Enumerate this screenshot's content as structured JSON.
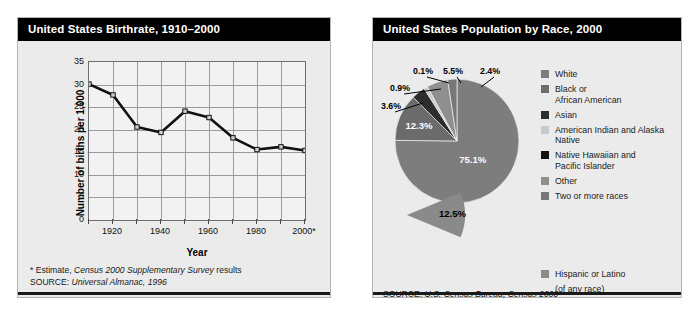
{
  "birthrate_panel": {
    "title": "United States Birthrate, 1910–2000",
    "footnote": "* Estimate, ",
    "footnote_italic": "Census 2000 Supplementary Survey",
    "footnote_tail": " results",
    "source_label": "SOURCE: ",
    "source_italic": "Universal Almanac, 1996"
  },
  "race_panel": {
    "title": "United States Population by Race, 2000",
    "source_label": "SOURCE: ",
    "source_italic": "U.S. Census Bureau, Census 2000",
    "hispanic_label": "Hispanic or Latino",
    "hispanic_note": "(of any race)",
    "hispanic_value": "12.5%"
  },
  "chart_data": [
    {
      "type": "line",
      "title": "United States Birthrate, 1910–2000",
      "xlabel": "Year",
      "ylabel": "Number of births per 1,000 population",
      "ylim": [
        0,
        35
      ],
      "ytick_step": 5,
      "yticks": [
        "0",
        "5",
        "10",
        "15",
        "20",
        "25",
        "30",
        "35"
      ],
      "xlim": [
        1910,
        2000
      ],
      "x": [
        1910,
        1920,
        1930,
        1940,
        1950,
        1960,
        1970,
        1980,
        1990,
        2000
      ],
      "xticklabels": [
        "",
        "1920",
        "",
        "1940",
        "",
        "1960",
        "",
        "1980",
        "",
        "2000*"
      ],
      "values": [
        30.1,
        27.7,
        20.6,
        19.4,
        24.1,
        22.7,
        18.2,
        15.6,
        16.2,
        15.4
      ],
      "grid": true,
      "legend": "none",
      "series_name": "Births per 1,000 population"
    },
    {
      "type": "pie",
      "title": "United States Population by Race, 2000",
      "labels": [
        "White",
        "Black or African American",
        "Asian",
        "American Indian and Alaska Native",
        "Native Hawaiian and Pacific Islander",
        "Other",
        "Two or more races"
      ],
      "values": [
        75.1,
        12.3,
        3.6,
        0.9,
        0.1,
        5.5,
        2.4
      ],
      "value_labels": [
        "75.1%",
        "12.3%",
        "3.6%",
        "0.9%",
        "0.1%",
        "5.5%",
        "2.4%"
      ],
      "colors": [
        "#7d7d7d",
        "#6b6b6b",
        "#2d2d2d",
        "#c9c9c9",
        "#141414",
        "#8f8f8f",
        "#787878"
      ],
      "detached_slice": {
        "label": "Hispanic or Latino",
        "sublabel": "(of any race)",
        "value": 12.5,
        "value_label": "12.5%",
        "color": "#8a8a8a"
      },
      "legend": "right"
    }
  ],
  "legend_items": [
    {
      "label_line1": "White",
      "label_line2": "",
      "color": "#7d7d7d"
    },
    {
      "label_line1": "Black or",
      "label_line2": "African American",
      "color": "#6e6e6e"
    },
    {
      "label_line1": "Asian",
      "label_line2": "",
      "color": "#2d2d2d"
    },
    {
      "label_line1": "American Indian and Alaska Native",
      "label_line2": "",
      "color": "#c9c9c9"
    },
    {
      "label_line1": "Native Hawaiian and",
      "label_line2": "Pacific Islander",
      "color": "#141414"
    },
    {
      "label_line1": "Other",
      "label_line2": "",
      "color": "#8f8f8f"
    },
    {
      "label_line1": "Two or more races",
      "label_line2": "",
      "color": "#787878"
    }
  ]
}
